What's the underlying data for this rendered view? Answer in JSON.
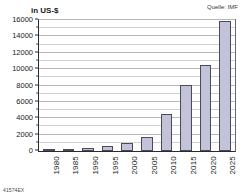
{
  "figure": {
    "unit_label": "in US-$",
    "source_label": "Quelle: IMF",
    "figure_id": "41574EX"
  },
  "chart_data": {
    "type": "bar",
    "title": "",
    "subtitle": "",
    "xlabel": "",
    "ylabel": "in US-$",
    "source": "Quelle: IMF",
    "categories": [
      "1980",
      "1985",
      "1990",
      "1995",
      "2000",
      "2005",
      "2010",
      "2015",
      "2020",
      "2025"
    ],
    "values": [
      300,
      300,
      420,
      650,
      1000,
      1750,
      4500,
      8100,
      10550,
      15900
    ],
    "series": [
      {
        "name": "in US-$",
        "values": [
          300,
          300,
          420,
          650,
          1000,
          1750,
          4500,
          8100,
          10550,
          15900
        ]
      }
    ],
    "ylim": [
      0,
      16000
    ],
    "y_ticks": [
      0,
      2000,
      4000,
      6000,
      8000,
      10000,
      12000,
      14000,
      16000
    ],
    "y_tick_labels": [
      "0",
      "2000",
      "4000",
      "6000",
      "8000",
      "10000",
      "12000",
      "14000",
      "16000"
    ],
    "y_minor_step": 1000,
    "grid": true,
    "grid_axis": "y",
    "legend": false,
    "legend_position": "none",
    "bar_color": "#c2c2d8",
    "bar_edge_color": "#4a4a5a",
    "axis_color": "#2b2b2b",
    "grid_color": "#b8b8b8",
    "background": "#ffffff"
  }
}
